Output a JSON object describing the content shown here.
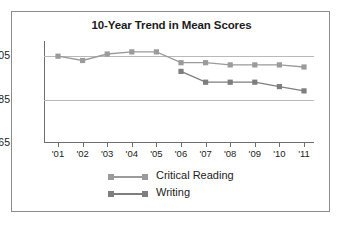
{
  "figure": {
    "border_color": "#8c8c8c",
    "background": "#ffffff"
  },
  "chart_data": {
    "type": "line",
    "title": "10-Year Trend in Mean Scores",
    "xlabel": "",
    "ylabel": "",
    "categories": [
      "'01",
      "'02",
      "'03",
      "'04",
      "'05",
      "'06",
      "'07",
      "'08",
      "'09",
      "'10",
      "'11"
    ],
    "ylim": [
      465,
      512
    ],
    "yticks": [
      465,
      485,
      505
    ],
    "ytick_labels": [
      "465",
      "485",
      "505"
    ],
    "grid": true,
    "legend_position": "bottom-center",
    "series": [
      {
        "name": "Critical Reading",
        "color": "#9b9b9b",
        "marker": "square",
        "values": [
          505,
          503,
          506,
          507,
          507,
          502,
          502,
          501,
          501,
          501,
          500
        ]
      },
      {
        "name": "Writing",
        "color": "#7e7e7e",
        "marker": "square",
        "values": [
          null,
          null,
          null,
          null,
          null,
          498,
          493,
          493,
          493,
          491,
          489
        ]
      }
    ]
  },
  "legend": {
    "entries": [
      {
        "label": "Critical Reading",
        "color": "#9b9b9b"
      },
      {
        "label": "Writing",
        "color": "#7e7e7e"
      }
    ]
  }
}
